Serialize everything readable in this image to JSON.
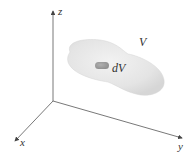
{
  "diagram": {
    "axes": {
      "z_label": "z",
      "x_label": "x",
      "y_label": "y"
    },
    "region_label": "V",
    "element_label": "dV",
    "colors": {
      "axis": "#555555",
      "region_fill": "#e6e6e6",
      "region_edge": "#d8d8d8",
      "element_fill": "#9a9a9a",
      "text": "#333333"
    }
  }
}
